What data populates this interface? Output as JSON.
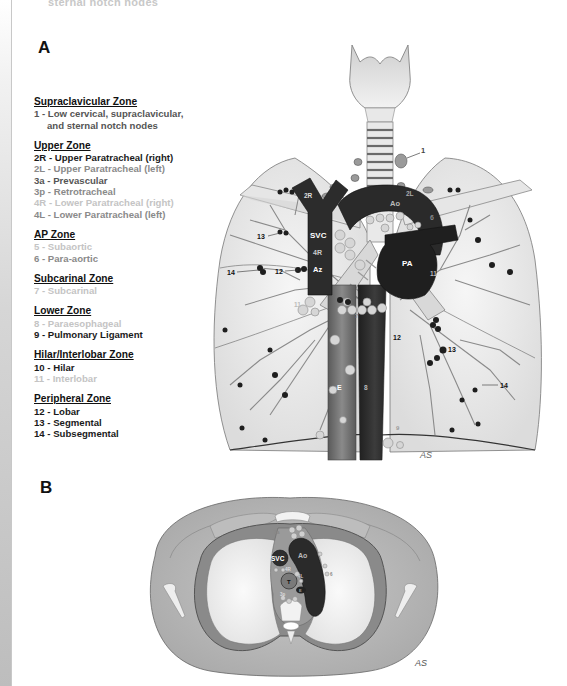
{
  "top_cut_text": "sternal notch nodes",
  "panels": {
    "a_label": "A",
    "b_label": "B"
  },
  "legend": {
    "zones": [
      {
        "title": "Supraclavicular Zone",
        "stations": [
          {
            "text": "1 - Low cervical, supraclavicular,",
            "tone": "mid"
          },
          {
            "text": "and sternal notch nodes",
            "tone": "mid",
            "indent": true
          }
        ]
      },
      {
        "title": "Upper Zone",
        "stations": [
          {
            "text": "2R - Upper Paratracheal (right)",
            "tone": "dark"
          },
          {
            "text": "2L - Upper Paratracheal (left)",
            "tone": "light"
          },
          {
            "text": "3a - Prevascular",
            "tone": "mid"
          },
          {
            "text": "3p - Retrotracheal",
            "tone": "light"
          },
          {
            "text": "4R - Lower Paratracheal (right)",
            "tone": "pale"
          },
          {
            "text": "4L - Lower Paratracheal (left)",
            "tone": "light"
          }
        ]
      },
      {
        "title": "AP Zone",
        "stations": [
          {
            "text": "5 - Subaortic",
            "tone": "pale"
          },
          {
            "text": "6 - Para-aortic",
            "tone": "light"
          }
        ]
      },
      {
        "title": "Subcarinal Zone",
        "stations": [
          {
            "text": "7 - Subcarinal",
            "tone": "pale"
          }
        ]
      },
      {
        "title": "Lower Zone",
        "stations": [
          {
            "text": "8 - Paraesophageal",
            "tone": "pale"
          },
          {
            "text": "9 - Pulmonary Ligament",
            "tone": "dark"
          }
        ]
      },
      {
        "title": "Hilar/Interlobar Zone",
        "stations": [
          {
            "text": "10 - Hilar",
            "tone": "dark"
          },
          {
            "text": "11 - Interlobar",
            "tone": "pale"
          }
        ]
      },
      {
        "title": "Peripheral Zone",
        "stations": [
          {
            "text": "12 - Lobar",
            "tone": "dark"
          },
          {
            "text": "13 - Segmental",
            "tone": "dark"
          },
          {
            "text": "14 - Subsegmental",
            "tone": "dark"
          }
        ]
      }
    ]
  },
  "figure_a": {
    "labels": {
      "station_1": "1",
      "station_2r": "2R",
      "station_2l": "2L",
      "svc": "SVC",
      "station_4r": "4R",
      "az": "Az",
      "ao": "Ao",
      "station_6": "6",
      "pa": "PA",
      "station_11_right": "11",
      "station_11_left": "11",
      "station_7": "7",
      "esophagus": "E",
      "station_8": "8",
      "station_9": "9",
      "station_12_right": "12",
      "station_13_right": "13",
      "station_14_right": "14",
      "station_12_left": "12",
      "station_13_left": "13",
      "station_14_left": "14",
      "signature": "AS"
    },
    "colors": {
      "vessel_dark": "#2a2a2a",
      "vessel_mid": "#4a4a4a",
      "esophagus": "#6d6d6d",
      "node_dark": "#1e1e1e",
      "node_light": "#d8d8d8",
      "lung_fill": "#efefef",
      "outline": "#777777"
    }
  },
  "figure_b": {
    "labels": {
      "station_3a": "3a",
      "svc": "SVC",
      "ao": "Ao",
      "station_4r": "4R",
      "trachea": "T",
      "station_4l": "4L",
      "esophagus": "E",
      "station_3p": "3p",
      "station_6": "6",
      "signature": "AS"
    }
  }
}
